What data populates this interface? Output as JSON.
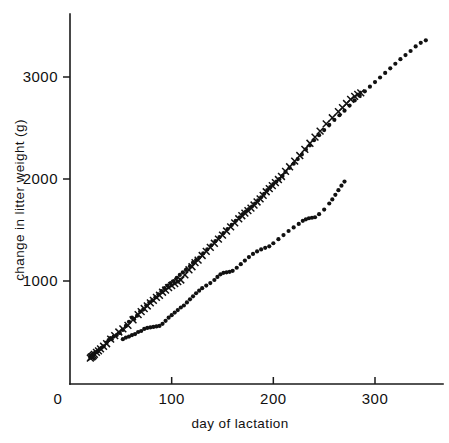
{
  "figure": {
    "name": "litter-weight-scatter",
    "background": "#ffffff",
    "ink": "#111111"
  },
  "chart_data": {
    "type": "scatter",
    "title": "",
    "subtitle": "",
    "xlabel": "day of lactation",
    "ylabel": "change in litter weight (g)",
    "xlim": [
      0,
      370
    ],
    "ylim": [
      0,
      3500
    ],
    "xticks": [
      0,
      100,
      200,
      300
    ],
    "xticklabels": [
      "0",
      "100",
      "200",
      "300"
    ],
    "yticks": [
      1000,
      2000,
      3000
    ],
    "yticklabels": [
      "1000",
      "2000",
      "3000"
    ],
    "grid": false,
    "legend": "none",
    "annotations": [],
    "series": [
      {
        "name": "upper-dots",
        "marker": "filled-circle",
        "color": "#111111",
        "points": [
          [
            20,
            250
          ],
          [
            21,
            265
          ],
          [
            22,
            255
          ],
          [
            23,
            275
          ],
          [
            24,
            290
          ],
          [
            25,
            300
          ],
          [
            27,
            310
          ],
          [
            29,
            330
          ],
          [
            31,
            345
          ],
          [
            33,
            360
          ],
          [
            36,
            395
          ],
          [
            38,
            420
          ],
          [
            40,
            440
          ],
          [
            41,
            430
          ],
          [
            43,
            455
          ],
          [
            46,
            470
          ],
          [
            49,
            490
          ],
          [
            52,
            520
          ],
          [
            55,
            560
          ],
          [
            58,
            600
          ],
          [
            61,
            640
          ],
          [
            63,
            625
          ],
          [
            66,
            660
          ],
          [
            69,
            700
          ],
          [
            72,
            720
          ],
          [
            75,
            760
          ],
          [
            78,
            790
          ],
          [
            81,
            810
          ],
          [
            84,
            840
          ],
          [
            87,
            870
          ],
          [
            90,
            900
          ],
          [
            93,
            930
          ],
          [
            96,
            955
          ],
          [
            99,
            980
          ],
          [
            102,
            1000
          ],
          [
            105,
            1030
          ],
          [
            108,
            1060
          ],
          [
            111,
            1085
          ],
          [
            114,
            1110
          ],
          [
            118,
            1145
          ],
          [
            121,
            1180
          ],
          [
            124,
            1205
          ],
          [
            127,
            1230
          ],
          [
            131,
            1270
          ],
          [
            135,
            1310
          ],
          [
            139,
            1350
          ],
          [
            143,
            1390
          ],
          [
            147,
            1430
          ],
          [
            151,
            1470
          ],
          [
            155,
            1510
          ],
          [
            159,
            1550
          ],
          [
            163,
            1590
          ],
          [
            167,
            1625
          ],
          [
            170,
            1655
          ],
          [
            173,
            1680
          ],
          [
            176,
            1705
          ],
          [
            179,
            1730
          ],
          [
            182,
            1760
          ],
          [
            185,
            1790
          ],
          [
            188,
            1820
          ],
          [
            191,
            1855
          ],
          [
            194,
            1890
          ],
          [
            197,
            1920
          ],
          [
            200,
            1950
          ],
          [
            203,
            1975
          ],
          [
            206,
            2000
          ],
          [
            209,
            2030
          ],
          [
            212,
            2070
          ],
          [
            216,
            2110
          ],
          [
            220,
            2150
          ],
          [
            224,
            2195
          ],
          [
            228,
            2240
          ],
          [
            232,
            2290
          ],
          [
            236,
            2330
          ],
          [
            240,
            2380
          ],
          [
            245,
            2430
          ],
          [
            250,
            2480
          ],
          [
            255,
            2530
          ],
          [
            260,
            2580
          ],
          [
            265,
            2625
          ],
          [
            270,
            2670
          ],
          [
            275,
            2720
          ],
          [
            280,
            2770
          ],
          [
            285,
            2815
          ],
          [
            290,
            2860
          ],
          [
            295,
            2905
          ],
          [
            300,
            2950
          ],
          [
            305,
            2995
          ],
          [
            310,
            3040
          ],
          [
            315,
            3085
          ],
          [
            320,
            3130
          ],
          [
            325,
            3175
          ],
          [
            330,
            3215
          ],
          [
            335,
            3255
          ],
          [
            340,
            3300
          ],
          [
            345,
            3335
          ],
          [
            350,
            3360
          ]
        ]
      },
      {
        "name": "upper-crosses",
        "marker": "cross",
        "color": "#111111",
        "points": [
          [
            20,
            245
          ],
          [
            21,
            255
          ],
          [
            22,
            260
          ],
          [
            23,
            270
          ],
          [
            24,
            280
          ],
          [
            26,
            300
          ],
          [
            28,
            315
          ],
          [
            30,
            335
          ],
          [
            33,
            360
          ],
          [
            36,
            385
          ],
          [
            40,
            430
          ],
          [
            44,
            465
          ],
          [
            48,
            500
          ],
          [
            52,
            530
          ],
          [
            57,
            565
          ],
          [
            62,
            620
          ],
          [
            67,
            670
          ],
          [
            70,
            700
          ],
          [
            73,
            730
          ],
          [
            76,
            755
          ],
          [
            79,
            785
          ],
          [
            82,
            810
          ],
          [
            85,
            840
          ],
          [
            88,
            860
          ],
          [
            91,
            890
          ],
          [
            94,
            910
          ],
          [
            97,
            935
          ],
          [
            100,
            955
          ],
          [
            103,
            975
          ],
          [
            106,
            995
          ],
          [
            109,
            1010
          ],
          [
            113,
            1060
          ],
          [
            117,
            1110
          ],
          [
            120,
            1140
          ],
          [
            123,
            1180
          ],
          [
            126,
            1205
          ],
          [
            130,
            1250
          ],
          [
            134,
            1290
          ],
          [
            138,
            1330
          ],
          [
            142,
            1370
          ],
          [
            146,
            1410
          ],
          [
            150,
            1450
          ],
          [
            154,
            1490
          ],
          [
            158,
            1530
          ],
          [
            162,
            1570
          ],
          [
            166,
            1610
          ],
          [
            169,
            1640
          ],
          [
            172,
            1665
          ],
          [
            175,
            1690
          ],
          [
            178,
            1715
          ],
          [
            181,
            1745
          ],
          [
            184,
            1775
          ],
          [
            187,
            1805
          ],
          [
            190,
            1840
          ],
          [
            193,
            1875
          ],
          [
            196,
            1905
          ],
          [
            199,
            1935
          ],
          [
            202,
            1965
          ],
          [
            205,
            1995
          ],
          [
            208,
            2025
          ],
          [
            212,
            2075
          ],
          [
            216,
            2120
          ],
          [
            221,
            2175
          ],
          [
            226,
            2230
          ],
          [
            231,
            2290
          ],
          [
            236,
            2350
          ],
          [
            241,
            2410
          ],
          [
            246,
            2470
          ],
          [
            252,
            2540
          ],
          [
            258,
            2600
          ],
          [
            264,
            2660
          ],
          [
            268,
            2700
          ],
          [
            272,
            2740
          ],
          [
            276,
            2780
          ],
          [
            280,
            2810
          ],
          [
            283,
            2830
          ],
          [
            286,
            2845
          ]
        ]
      },
      {
        "name": "lower-dots",
        "marker": "filled-circle",
        "color": "#111111",
        "points": [
          [
            52,
            430
          ],
          [
            55,
            445
          ],
          [
            58,
            455
          ],
          [
            61,
            470
          ],
          [
            64,
            480
          ],
          [
            67,
            500
          ],
          [
            70,
            510
          ],
          [
            73,
            530
          ],
          [
            76,
            540
          ],
          [
            79,
            545
          ],
          [
            82,
            550
          ],
          [
            85,
            555
          ],
          [
            88,
            560
          ],
          [
            91,
            580
          ],
          [
            94,
            610
          ],
          [
            97,
            640
          ],
          [
            100,
            665
          ],
          [
            103,
            690
          ],
          [
            106,
            715
          ],
          [
            109,
            740
          ],
          [
            112,
            760
          ],
          [
            115,
            790
          ],
          [
            118,
            820
          ],
          [
            121,
            850
          ],
          [
            124,
            880
          ],
          [
            127,
            905
          ],
          [
            130,
            930
          ],
          [
            134,
            955
          ],
          [
            138,
            980
          ],
          [
            142,
            1010
          ],
          [
            145,
            1040
          ],
          [
            148,
            1065
          ],
          [
            151,
            1080
          ],
          [
            154,
            1085
          ],
          [
            157,
            1090
          ],
          [
            160,
            1100
          ],
          [
            164,
            1130
          ],
          [
            168,
            1165
          ],
          [
            172,
            1200
          ],
          [
            176,
            1235
          ],
          [
            180,
            1265
          ],
          [
            184,
            1290
          ],
          [
            188,
            1310
          ],
          [
            192,
            1325
          ],
          [
            196,
            1340
          ],
          [
            200,
            1370
          ],
          [
            205,
            1410
          ],
          [
            210,
            1450
          ],
          [
            215,
            1490
          ],
          [
            220,
            1525
          ],
          [
            225,
            1560
          ],
          [
            229,
            1590
          ],
          [
            232,
            1605
          ],
          [
            235,
            1615
          ],
          [
            238,
            1620
          ],
          [
            241,
            1625
          ],
          [
            245,
            1655
          ],
          [
            250,
            1700
          ],
          [
            255,
            1760
          ],
          [
            258,
            1800
          ],
          [
            261,
            1845
          ],
          [
            264,
            1890
          ],
          [
            267,
            1935
          ],
          [
            270,
            1975
          ]
        ]
      }
    ]
  }
}
